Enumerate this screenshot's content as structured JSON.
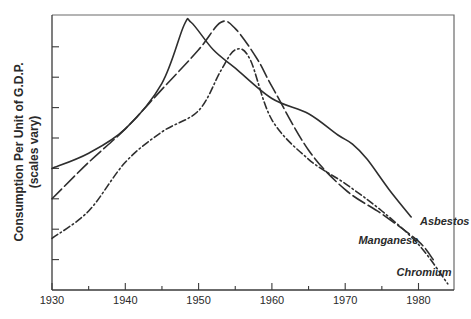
{
  "chart_data": {
    "type": "line",
    "title": "",
    "xlabel": "",
    "ylabel": "Consumption Per Unit of G.D.P.",
    "ylabel_sub": "(scales vary)",
    "xlim": [
      1930,
      1985
    ],
    "ylim": [
      0,
      9.1
    ],
    "x_ticks": [
      1930,
      1935,
      1940,
      1945,
      1950,
      1955,
      1960,
      1965,
      1970,
      1975,
      1980
    ],
    "x_tick_labels": [
      "1930",
      "1940",
      "1950",
      "1960",
      "1970",
      "1980"
    ],
    "y_ticks": [
      1,
      2,
      3,
      4,
      5,
      6,
      7,
      8
    ],
    "y_tick_labels": [],
    "grid": false,
    "legend": "inline labels at line ends",
    "series": [
      {
        "name": "Asbestos",
        "style": "solid",
        "label_pos": [
          1980.2,
          2.15
        ],
        "points": [
          [
            1930,
            4.0
          ],
          [
            1935,
            4.5
          ],
          [
            1940,
            5.3
          ],
          [
            1945,
            6.8
          ],
          [
            1948,
            8.7
          ],
          [
            1949,
            8.8
          ],
          [
            1952,
            7.9
          ],
          [
            1955,
            7.3
          ],
          [
            1960,
            6.3
          ],
          [
            1965,
            5.8
          ],
          [
            1969,
            5.1
          ],
          [
            1971,
            4.8
          ],
          [
            1973,
            4.3
          ],
          [
            1976,
            3.3
          ],
          [
            1979,
            2.4
          ]
        ]
      },
      {
        "name": "Manganese",
        "style": "long-dash",
        "label_pos": [
          1971.8,
          1.5
        ],
        "points": [
          [
            1930,
            3.0
          ],
          [
            1935,
            4.2
          ],
          [
            1940,
            5.3
          ],
          [
            1945,
            6.6
          ],
          [
            1950,
            7.9
          ],
          [
            1953,
            8.8
          ],
          [
            1955,
            8.6
          ],
          [
            1958,
            7.6
          ],
          [
            1960,
            6.7
          ],
          [
            1965,
            4.6
          ],
          [
            1970,
            3.3
          ],
          [
            1975,
            2.5
          ],
          [
            1980,
            1.6
          ],
          [
            1982,
            1.0
          ]
        ]
      },
      {
        "name": "Chromium",
        "style": "dash-dot",
        "label_pos": [
          1977,
          0.45
        ],
        "points": [
          [
            1930,
            1.7
          ],
          [
            1935,
            2.6
          ],
          [
            1940,
            4.2
          ],
          [
            1945,
            5.2
          ],
          [
            1950,
            5.9
          ],
          [
            1953,
            7.2
          ],
          [
            1955,
            7.9
          ],
          [
            1957,
            7.6
          ],
          [
            1960,
            5.6
          ],
          [
            1965,
            4.3
          ],
          [
            1970,
            3.5
          ],
          [
            1975,
            2.6
          ],
          [
            1980,
            1.5
          ],
          [
            1984,
            0.2
          ]
        ]
      }
    ]
  },
  "labels": {
    "ylabel": "Consumption Per Unit of G.D.P.",
    "ylabel_sub": "(scales vary)"
  },
  "colors": {
    "line": "#2e2e2e",
    "axis": "#3a3a3a",
    "background": "#ffffff"
  }
}
